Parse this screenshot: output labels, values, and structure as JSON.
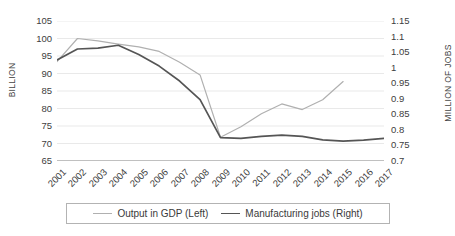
{
  "chart_data": {
    "type": "line",
    "title": "",
    "xlabel": "",
    "ylabel": "BILLION",
    "y2label": "MILLION OF JOBS",
    "grid": true,
    "legend_position": "bottom",
    "x": [
      2001,
      2002,
      2003,
      2004,
      2005,
      2006,
      2007,
      2008,
      2009,
      2010,
      2011,
      2012,
      2013,
      2014,
      2015,
      2016,
      2017
    ],
    "xticklabels": [
      "2001",
      "2002",
      "2003",
      "2004",
      "2005",
      "2006",
      "2007",
      "2008",
      "2009",
      "2010",
      "2011",
      "2012",
      "2013",
      "2014",
      "2015",
      "2016",
      "2017"
    ],
    "ylim": [
      65,
      105
    ],
    "yticks": [
      65,
      70,
      75,
      80,
      85,
      90,
      95,
      100,
      105
    ],
    "yticklabels": [
      "65",
      "70",
      "75",
      "80",
      "85",
      "90",
      "95",
      "100",
      "105"
    ],
    "y2lim": [
      0.7,
      1.15
    ],
    "y2ticks": [
      0.7,
      0.75,
      0.8,
      0.85,
      0.9,
      0.95,
      1.0,
      1.05,
      1.1,
      1.15
    ],
    "y2ticklabels": [
      "0.7",
      "0.75",
      "0.8",
      "0.85",
      "0.9",
      "0.95",
      "1",
      "1.05",
      "1.1",
      "1.15"
    ],
    "series": [
      {
        "name": "Output in GDP (Left)",
        "axis": "left",
        "color": "#b0b0b0",
        "width": 1.2,
        "values": [
          93.4,
          100.0,
          99.3,
          98.4,
          97.6,
          96.3,
          93.2,
          89.6,
          71.8,
          74.8,
          78.5,
          81.3,
          79.7,
          82.5,
          87.7,
          null,
          null
        ]
      },
      {
        "name": "Manufacturing jobs (Right)",
        "axis": "right",
        "color": "#555555",
        "width": 1.7,
        "values": [
          1.025,
          1.06,
          1.063,
          1.072,
          1.042,
          1.005,
          0.957,
          0.897,
          0.775,
          0.773,
          0.779,
          0.783,
          0.779,
          0.768,
          0.764,
          0.767,
          0.773
        ]
      }
    ]
  },
  "legend": {
    "items": [
      {
        "label": "Output in GDP (Left)",
        "color": "#b0b0b0"
      },
      {
        "label": "Manufacturing jobs (Right)",
        "color": "#555555"
      }
    ]
  }
}
